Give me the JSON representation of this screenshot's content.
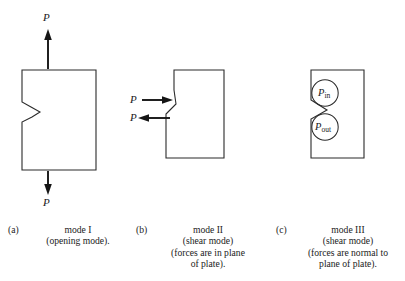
{
  "figure": {
    "background_color": "#ffffff",
    "line_color": "#2b2b2b",
    "arrow_color": "#151515",
    "text_color": "#1a1a1a"
  },
  "panels": [
    {
      "id": "a",
      "tag": "(a)",
      "load_label_top": "P",
      "load_label_bottom": "P",
      "caption_lines": [
        "mode I",
        "(opening mode)."
      ],
      "crack_location": "left-edge-mid",
      "arrow_directions": [
        "up",
        "down"
      ]
    },
    {
      "id": "b",
      "tag": "(b)",
      "load_label_top": "P",
      "load_label_bottom": "P",
      "caption_lines": [
        "mode II",
        "(shear mode)",
        "(forces are in plane",
        "of plate)."
      ],
      "crack_location": "left-edge-mid",
      "arrow_directions": [
        "right",
        "left"
      ]
    },
    {
      "id": "c",
      "tag": "(c)",
      "caption_lines": [
        "mode III",
        "(shear mode)",
        "(forces are normal to",
        "plane of plate)."
      ],
      "crack_location": "left-edge-mid",
      "circles": [
        {
          "name": "p-in",
          "symbol": "P",
          "subscript": "in"
        },
        {
          "name": "p-out",
          "symbol": "P",
          "subscript": "out"
        }
      ]
    }
  ]
}
